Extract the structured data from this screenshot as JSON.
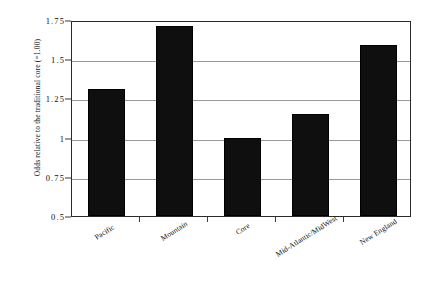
{
  "chart_data": {
    "type": "bar",
    "title": "",
    "xlabel": "",
    "ylabel": "Odds relative to the traditional core (=1.00)",
    "categories": [
      "Pacific",
      "Mountain",
      "Core",
      "Mid-Atlantic/MidWest",
      "New England"
    ],
    "values": [
      1.31,
      1.71,
      1.0,
      1.15,
      1.59
    ],
    "ylim": [
      0.5,
      1.75
    ],
    "ytick_labels": [
      "0.5",
      "0.75",
      "1",
      "1.25",
      "1.5",
      "1.75"
    ],
    "ytick_values": [
      0.5,
      0.75,
      1,
      1.25,
      1.5,
      1.75
    ],
    "grid": true,
    "legend": null,
    "bar_color": "#100f0f",
    "axis_color": "#2b2b2b",
    "grid_color": "#9a9a9a"
  }
}
